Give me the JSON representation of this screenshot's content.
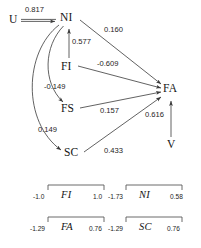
{
  "diagram": {
    "nodes": [
      {
        "id": "U",
        "label": "U",
        "x": 11,
        "y": 16
      },
      {
        "id": "NI",
        "label": "NI",
        "x": 63,
        "y": 13
      },
      {
        "id": "FI",
        "label": "FI",
        "x": 63,
        "y": 62
      },
      {
        "id": "FS",
        "label": "FS",
        "x": 63,
        "y": 105
      },
      {
        "id": "SC",
        "label": "SC",
        "x": 66,
        "y": 150
      },
      {
        "id": "FA",
        "label": "FA",
        "x": 165,
        "y": 84
      },
      {
        "id": "V",
        "label": "V",
        "x": 168,
        "y": 140
      }
    ],
    "edges": [
      {
        "id": "u-ni",
        "from": "U",
        "to": "NI",
        "coefficient": "0.817",
        "label_x": 25,
        "label_y": 6
      },
      {
        "id": "ni-fa",
        "from": "NI",
        "to": "FA",
        "coefficient": "0.160",
        "label_x": 105,
        "label_y": 27
      },
      {
        "id": "fi-ni",
        "from": "FI",
        "to": "NI",
        "coefficient": "0.577",
        "label_x": 74,
        "label_y": 38
      },
      {
        "id": "fi-fa",
        "from": "FI",
        "to": "FA",
        "coefficient": "-0.609",
        "label_x": 98,
        "label_y": 61
      },
      {
        "id": "ni-fs",
        "from": "NI",
        "to": "FS",
        "coefficient": "-0.149",
        "label_x": 46,
        "label_y": 84
      },
      {
        "id": "fs-fa",
        "from": "FS",
        "to": "FA",
        "coefficient": "0.157",
        "label_x": 101,
        "label_y": 108
      },
      {
        "id": "ni-sc",
        "from": "NI",
        "to": "SC",
        "coefficient": "0.149",
        "label_x": 40,
        "label_y": 127
      },
      {
        "id": "sc-fa",
        "from": "SC",
        "to": "FA",
        "coefficient": "0.433",
        "label_x": 105,
        "label_y": 148
      },
      {
        "id": "v-fa",
        "from": "V",
        "to": "FA",
        "coefficient": "0.616",
        "label_x": 146,
        "label_y": 112
      }
    ]
  },
  "scales": {
    "rows": [
      {
        "items": [
          {
            "id": "scale-fi",
            "name": "FI",
            "min": "-1.0",
            "max": "1.0",
            "bracket_x": 48,
            "bracket_w": 56,
            "y": 185
          },
          {
            "id": "scale-ni",
            "name": "NI",
            "min": "-1.73",
            "max": "0.58",
            "bracket_x": 126,
            "bracket_w": 56,
            "y": 185
          }
        ]
      },
      {
        "items": [
          {
            "id": "scale-fa",
            "name": "FA",
            "min": "-1.29",
            "max": "0.76",
            "bracket_x": 48,
            "bracket_w": 56,
            "y": 217
          },
          {
            "id": "scale-sc",
            "name": "SC",
            "min": "-1.29",
            "max": "0.76",
            "bracket_x": 126,
            "bracket_w": 56,
            "y": 217
          }
        ]
      }
    ]
  },
  "style": {
    "stroke": "#3a3a3a",
    "text": "#151515",
    "background": "#ffffff"
  }
}
